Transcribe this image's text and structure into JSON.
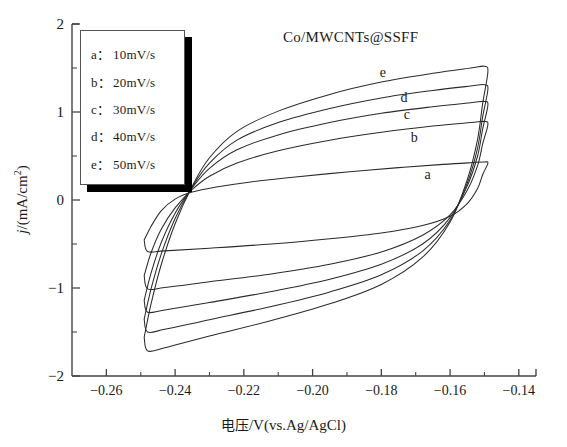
{
  "chart_data": {
    "type": "line",
    "title": "Co/MWCNTs@SSFF",
    "xlabel": "电压/V(vs.Ag/AgCl)",
    "ylabel": "j/(mA/cm2)",
    "xlim": [
      -0.27,
      -0.135
    ],
    "ylim": [
      -2,
      2
    ],
    "grid": false,
    "legend_position": "top-left",
    "xticks": [
      "-0.26",
      "-0.24",
      "-0.22",
      "-0.20",
      "-0.18",
      "-0.16",
      "-0.14"
    ],
    "xtick_values": [
      -0.26,
      -0.24,
      -0.22,
      -0.2,
      -0.18,
      -0.16,
      -0.14
    ],
    "yticks": [
      "2",
      "1",
      "0",
      "-1",
      "-2"
    ],
    "ytick_values": [
      2,
      1,
      0,
      -1,
      -2
    ],
    "xminor_step": 0.01,
    "yminor_step": 0.5,
    "legend": [
      {
        "key": "a：",
        "label": "10mV/s"
      },
      {
        "key": "b：",
        "label": "20mV/s"
      },
      {
        "key": "c：",
        "label": "30mV/s"
      },
      {
        "key": "d：",
        "label": "40mV/s"
      },
      {
        "key": "e：",
        "label": "50mV/s"
      }
    ],
    "curve_labels": [
      "a",
      "b",
      "c",
      "d",
      "e"
    ],
    "series": [
      {
        "name": "a",
        "scan_rate_mV_s": 10,
        "anodic": [
          [
            -0.249,
            -0.455
          ],
          [
            -0.247,
            -0.3
          ],
          [
            -0.244,
            -0.12
          ],
          [
            -0.24,
            0.01
          ],
          [
            -0.235,
            0.09
          ],
          [
            -0.228,
            0.147
          ],
          [
            -0.218,
            0.205
          ],
          [
            -0.205,
            0.262
          ],
          [
            -0.19,
            0.318
          ],
          [
            -0.175,
            0.368
          ],
          [
            -0.162,
            0.405
          ],
          [
            -0.154,
            0.424
          ],
          [
            -0.15,
            0.432
          ],
          [
            -0.149,
            0.418
          ]
        ],
        "cathodic": [
          [
            -0.149,
            0.418
          ],
          [
            -0.1505,
            0.29
          ],
          [
            -0.152,
            0.13
          ],
          [
            -0.155,
            -0.04
          ],
          [
            -0.16,
            -0.185
          ],
          [
            -0.168,
            -0.29
          ],
          [
            -0.18,
            -0.375
          ],
          [
            -0.195,
            -0.44
          ],
          [
            -0.212,
            -0.5
          ],
          [
            -0.23,
            -0.548
          ],
          [
            -0.243,
            -0.578
          ],
          [
            -0.248,
            -0.585
          ],
          [
            -0.249,
            -0.455
          ]
        ]
      },
      {
        "name": "b",
        "scan_rate_mV_s": 20,
        "anodic": [
          [
            -0.249,
            -0.86
          ],
          [
            -0.247,
            -0.6
          ],
          [
            -0.244,
            -0.33
          ],
          [
            -0.24,
            -0.09
          ],
          [
            -0.235,
            0.12
          ],
          [
            -0.23,
            0.27
          ],
          [
            -0.222,
            0.42
          ],
          [
            -0.21,
            0.56
          ],
          [
            -0.195,
            0.68
          ],
          [
            -0.18,
            0.77
          ],
          [
            -0.165,
            0.84
          ],
          [
            -0.154,
            0.88
          ],
          [
            -0.15,
            0.893
          ],
          [
            -0.149,
            0.855
          ]
        ],
        "cathodic": [
          [
            -0.149,
            0.855
          ],
          [
            -0.1505,
            0.64
          ],
          [
            -0.152,
            0.39
          ],
          [
            -0.155,
            0.11
          ],
          [
            -0.16,
            -0.17
          ],
          [
            -0.168,
            -0.4
          ],
          [
            -0.18,
            -0.59
          ],
          [
            -0.195,
            -0.73
          ],
          [
            -0.212,
            -0.84
          ],
          [
            -0.23,
            -0.93
          ],
          [
            -0.243,
            -0.995
          ],
          [
            -0.248,
            -1.01
          ],
          [
            -0.249,
            -0.86
          ]
        ]
      },
      {
        "name": "c",
        "scan_rate_mV_s": 30,
        "anodic": [
          [
            -0.249,
            -1.14
          ],
          [
            -0.247,
            -0.83
          ],
          [
            -0.244,
            -0.48
          ],
          [
            -0.24,
            -0.15
          ],
          [
            -0.235,
            0.14
          ],
          [
            -0.23,
            0.36
          ],
          [
            -0.222,
            0.57
          ],
          [
            -0.21,
            0.74
          ],
          [
            -0.195,
            0.88
          ],
          [
            -0.18,
            0.985
          ],
          [
            -0.165,
            1.06
          ],
          [
            -0.154,
            1.105
          ],
          [
            -0.15,
            1.12
          ],
          [
            -0.149,
            1.075
          ]
        ],
        "cathodic": [
          [
            -0.149,
            1.075
          ],
          [
            -0.1505,
            0.81
          ],
          [
            -0.152,
            0.5
          ],
          [
            -0.155,
            0.16
          ],
          [
            -0.16,
            -0.2
          ],
          [
            -0.168,
            -0.5
          ],
          [
            -0.18,
            -0.73
          ],
          [
            -0.195,
            -0.9
          ],
          [
            -0.212,
            -1.04
          ],
          [
            -0.23,
            -1.165
          ],
          [
            -0.243,
            -1.25
          ],
          [
            -0.248,
            -1.275
          ],
          [
            -0.249,
            -1.14
          ]
        ]
      },
      {
        "name": "d",
        "scan_rate_mV_s": 40,
        "anodic": [
          [
            -0.249,
            -1.355
          ],
          [
            -0.247,
            -1.01
          ],
          [
            -0.244,
            -0.61
          ],
          [
            -0.24,
            -0.21
          ],
          [
            -0.235,
            0.15
          ],
          [
            -0.23,
            0.42
          ],
          [
            -0.222,
            0.68
          ],
          [
            -0.21,
            0.88
          ],
          [
            -0.195,
            1.04
          ],
          [
            -0.18,
            1.16
          ],
          [
            -0.165,
            1.245
          ],
          [
            -0.154,
            1.295
          ],
          [
            -0.15,
            1.31
          ],
          [
            -0.149,
            1.255
          ]
        ],
        "cathodic": [
          [
            -0.149,
            1.255
          ],
          [
            -0.1505,
            0.95
          ],
          [
            -0.152,
            0.59
          ],
          [
            -0.155,
            0.19
          ],
          [
            -0.16,
            -0.23
          ],
          [
            -0.168,
            -0.58
          ],
          [
            -0.18,
            -0.85
          ],
          [
            -0.195,
            -1.045
          ],
          [
            -0.212,
            -1.21
          ],
          [
            -0.23,
            -1.36
          ],
          [
            -0.243,
            -1.47
          ],
          [
            -0.248,
            -1.5
          ],
          [
            -0.249,
            -1.355
          ]
        ]
      },
      {
        "name": "e",
        "scan_rate_mV_s": 50,
        "anodic": [
          [
            -0.249,
            -1.56
          ],
          [
            -0.247,
            -1.18
          ],
          [
            -0.244,
            -0.73
          ],
          [
            -0.24,
            -0.27
          ],
          [
            -0.235,
            0.16
          ],
          [
            -0.23,
            0.48
          ],
          [
            -0.222,
            0.78
          ],
          [
            -0.21,
            1.01
          ],
          [
            -0.195,
            1.2
          ],
          [
            -0.18,
            1.34
          ],
          [
            -0.165,
            1.44
          ],
          [
            -0.154,
            1.5
          ],
          [
            -0.15,
            1.52
          ],
          [
            -0.149,
            1.455
          ]
        ],
        "cathodic": [
          [
            -0.149,
            1.455
          ],
          [
            -0.1505,
            1.1
          ],
          [
            -0.152,
            0.69
          ],
          [
            -0.155,
            0.23
          ],
          [
            -0.16,
            -0.25
          ],
          [
            -0.168,
            -0.65
          ],
          [
            -0.18,
            -0.96
          ],
          [
            -0.195,
            -1.18
          ],
          [
            -0.212,
            -1.37
          ],
          [
            -0.23,
            -1.545
          ],
          [
            -0.243,
            -1.68
          ],
          [
            -0.248,
            -1.715
          ],
          [
            -0.249,
            -1.56
          ]
        ]
      }
    ],
    "curve_label_positions": [
      {
        "name": "a",
        "x": -0.166,
        "y": 0.275
      },
      {
        "name": "b",
        "x": -0.17,
        "y": 0.69
      },
      {
        "name": "c",
        "x": -0.172,
        "y": 0.96
      },
      {
        "name": "d",
        "x": -0.173,
        "y": 1.15
      },
      {
        "name": "e",
        "x": -0.179,
        "y": 1.43
      }
    ]
  }
}
